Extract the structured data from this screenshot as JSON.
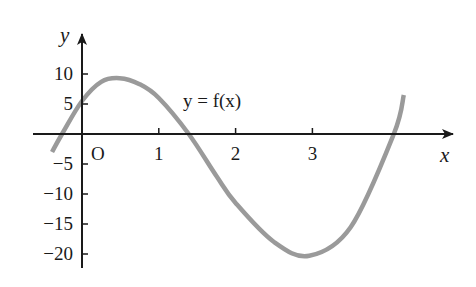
{
  "chart_data": {
    "type": "line",
    "title": "",
    "xlabel": "x",
    "ylabel": "y",
    "origin_label": "O",
    "curve_label": "y = f(x)",
    "x_ticks": [
      1,
      2,
      3
    ],
    "x_tick_labels": [
      "1",
      "2",
      "3"
    ],
    "y_ticks": [
      10,
      5,
      -5,
      -10,
      -15,
      -20
    ],
    "y_tick_labels": [
      "10",
      "5",
      "−5",
      "−10",
      "−15",
      "−20"
    ],
    "xlim": [
      -0.5,
      4.6
    ],
    "ylim": [
      -22,
      15
    ],
    "grid": false,
    "legend": "none",
    "series": [
      {
        "name": "y = f(x)",
        "color": "#9a9a9a",
        "x": [
          -0.39,
          -0.26,
          0,
          0.25,
          0.49,
          0.75,
          1.0,
          1.39,
          1.75,
          2.0,
          2.5,
          2.96,
          3.5,
          4.06,
          4.19
        ],
        "y": [
          -3,
          0,
          5.5,
          8.7,
          9.3,
          8.3,
          6.0,
          0,
          -7,
          -11.5,
          -18,
          -20.3,
          -15.5,
          0,
          6.5
        ]
      }
    ],
    "key_points": {
      "roots": [
        -0.26,
        1.39,
        4.06
      ],
      "local_max": {
        "x": 0.49,
        "y": 9.3
      },
      "local_min": {
        "x": 2.96,
        "y": -20.3
      },
      "y_intercept": 5.5
    }
  },
  "colors": {
    "axis": "#1a1a1a",
    "curve": "#9a9a9a",
    "background": "#ffffff"
  }
}
